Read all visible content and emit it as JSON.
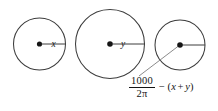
{
  "figure": {
    "background_color": "#ffffff",
    "stroke_color": "#3c3c3c",
    "dot_color": "#151515",
    "leader_color": "#7e7e7e",
    "text_color": "#141414"
  },
  "circles": [
    {
      "id": "circle-1",
      "cx": 39.5,
      "cy": 44,
      "r": 26,
      "radius_label": "x",
      "label_x": 51.5,
      "label_y": 47,
      "radius_line": {
        "x1": 41.5,
        "y1": 44,
        "x2": 65.5,
        "y2": 44
      },
      "dot_r": 2.6
    },
    {
      "id": "circle-2",
      "cx": 110,
      "cy": 44,
      "r": 34.5,
      "radius_label": "y",
      "label_x": 121,
      "label_y": 47,
      "radius_line": {
        "x1": 112,
        "y1": 44,
        "x2": 144.5,
        "y2": 44
      },
      "dot_r": 2.8
    },
    {
      "id": "circle-3",
      "cx": 180,
      "cy": 45,
      "r": 25,
      "radius_label": "",
      "label_x": 0,
      "label_y": 0,
      "radius_line": {
        "x1": 182,
        "y1": 45,
        "x2": 205,
        "y2": 45
      },
      "dot_r": 2.8
    }
  ],
  "leader": {
    "name": "leader-line-to-formula",
    "x1": 178.5,
    "y1": 46,
    "x2": 139,
    "y2": 76
  },
  "formula": {
    "numerator": "1000",
    "denominator": "2π",
    "operator": "−",
    "open_paren": "(",
    "var_first": "x",
    "plus": "+",
    "var_second": "y",
    "close_paren": ")",
    "full_text": "1000/(2π) − (x + y)"
  }
}
